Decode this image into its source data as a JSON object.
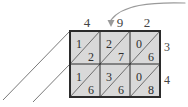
{
  "diagram": {
    "type": "lattice-multiplication",
    "grid": {
      "columns": 3,
      "rows": 2,
      "left": 70,
      "top": 31,
      "right": 160,
      "bottom": 97,
      "cell_width": 30,
      "cell_height": 33,
      "fill_color": "#d9d9d9",
      "border_color": "#2b2b2b",
      "diagonal_color": "#6e6e6e",
      "outer_border_width": 2,
      "inner_line_width": 1
    },
    "top_labels": [
      {
        "value": "4",
        "column": 0
      },
      {
        "value": "9",
        "column": 1
      },
      {
        "value": "2",
        "column": 2
      }
    ],
    "right_labels": [
      {
        "value": "3",
        "row": 0
      },
      {
        "value": "4",
        "row": 1
      }
    ],
    "cells": [
      {
        "row": 0,
        "col": 0,
        "upper_left_digit": "1",
        "lower_right_digit": "2"
      },
      {
        "row": 0,
        "col": 1,
        "upper_left_digit": "2",
        "lower_right_digit": "7"
      },
      {
        "row": 0,
        "col": 2,
        "upper_left_digit": "0",
        "lower_right_digit": "6"
      },
      {
        "row": 1,
        "col": 0,
        "upper_left_digit": "1",
        "lower_right_digit": "6"
      },
      {
        "row": 1,
        "col": 1,
        "upper_left_digit": "3",
        "lower_right_digit": "6"
      },
      {
        "row": 1,
        "col": 2,
        "upper_left_digit": "0",
        "lower_right_digit": "8"
      }
    ],
    "annotation_arrow": {
      "name": "curved-arrow-to-nine",
      "points_to": "9",
      "color": "#9a9a9a"
    },
    "extension_lines": [
      {
        "name": "diagonal-extension-upper",
        "color": "#7a7a7a"
      },
      {
        "name": "diagonal-extension-lower",
        "color": "#7a7a7a"
      }
    ]
  }
}
